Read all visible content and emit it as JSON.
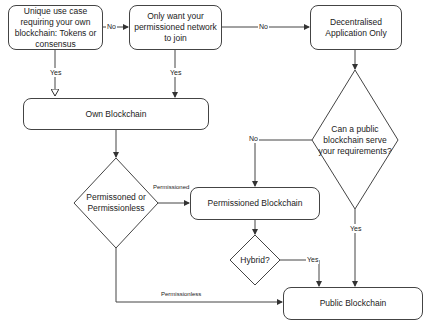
{
  "diagram": {
    "nodes": {
      "unique_use_case": "Unique use case requiring your own blockchain: Tokens or consensus",
      "permissioned_network": "Only want your permissioned network to join",
      "decentralised_app": "Decentralised Application Only",
      "own_blockchain": "Own Blockchain",
      "public_question": "Can a public blockchain serve your requirements?",
      "perm_or_permless": "Permissoned or Permissionless",
      "permissioned_blockchain": "Permissioned Blockchain",
      "hybrid": "Hybrid?",
      "public_blockchain": "Public Blockchain"
    },
    "edge_labels": {
      "unique_to_network_no": "No",
      "network_to_dapp_no": "No",
      "unique_to_own_yes": "Yes",
      "network_to_own_yes": "Yes",
      "public_q_no": "No",
      "public_q_yes": "Yes",
      "permissioned": "Permissioned",
      "permissionless": "Permissionless",
      "hybrid_yes": "Yes"
    }
  }
}
